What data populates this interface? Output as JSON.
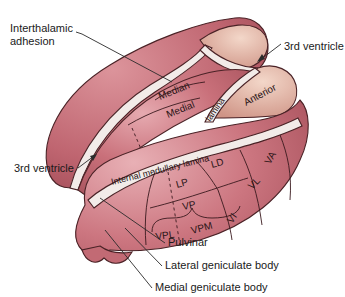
{
  "figure": {
    "colors": {
      "tissue": "#c9707a",
      "tissue_light": "#e3a5ab",
      "tissue_dark": "#a8505b",
      "anterior_nucleus": "#e4b8a8",
      "lamina": "#f1e8e4",
      "outline": "#4a2226",
      "background": "#ffffff"
    }
  },
  "external_labels": {
    "interthalamic_adhesion_line1": "Interthalamic",
    "interthalamic_adhesion_line2": "adhesion",
    "third_ventricle_top": "3rd ventricle",
    "third_ventricle_left": "3rd ventricle",
    "pulvinar": "Pulvinar",
    "lateral_geniculate_body": "Lateral geniculate body",
    "medial_geniculate_body": "Medial geniculate body"
  },
  "nucleus_labels": {
    "median": "Median",
    "medial": "Medial",
    "anterior": "Anterior",
    "lamina": "lamina",
    "internal_medullary_lamina": "Internal medullary lamina",
    "ld": "LD",
    "lp": "LP",
    "va": "VA",
    "vl": "VL",
    "vp": "VP",
    "vi": "VI",
    "vpl": "VPL",
    "vpm": "VPM"
  }
}
